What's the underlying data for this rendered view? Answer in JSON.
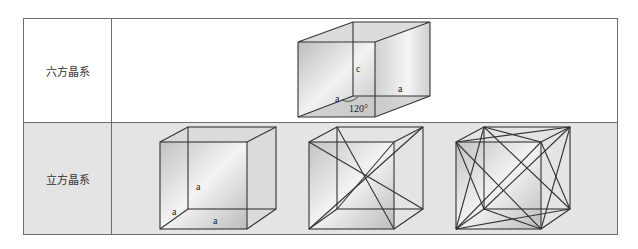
{
  "table": {
    "rows": [
      {
        "label": "六方晶系",
        "figures": [
          {
            "type": "hexagonal-prism-unit",
            "edge_labels": {
              "height": "c",
              "base_edge_1": "a",
              "base_edge_2": "a"
            },
            "angle_label": "120°"
          }
        ]
      },
      {
        "label": "立方晶系",
        "figures": [
          {
            "type": "simple-cubic",
            "edge_labels": {
              "height": "a",
              "depth": "a",
              "width": "a"
            }
          },
          {
            "type": "body-centered-cubic",
            "description": "cube with body diagonals"
          },
          {
            "type": "face-centered-cubic",
            "description": "cube with face diagonals"
          }
        ]
      }
    ]
  },
  "colors": {
    "border": "#6e6e6e",
    "row1_bg": "#ffffff",
    "row2_bg": "#e4e4e4",
    "edge": "#333333"
  }
}
